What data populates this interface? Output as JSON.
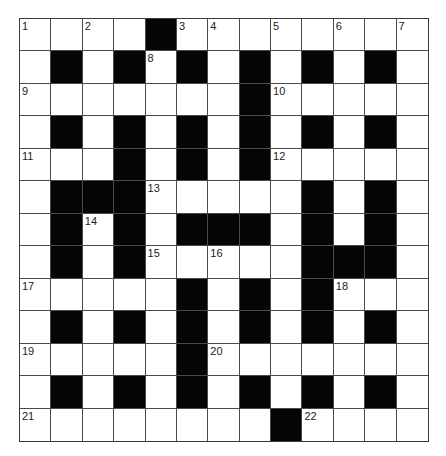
{
  "puzzle": {
    "type": "crossword",
    "rows": 13,
    "cols": 13,
    "colors": {
      "block": "#050505",
      "cell": "#ffffff",
      "gridline": "#4a4a4a",
      "number": "#222222"
    },
    "layout": [
      "0000100000000",
      "0101010101010",
      "0000000100000",
      "0101010101010",
      "0001010100000",
      "0111000001010",
      "0101011101010",
      "0101000001110",
      "0000010101000",
      "0101010101010",
      "0000010000000",
      "0101010101010",
      "0000000010000"
    ],
    "numbers": [
      {
        "row": 0,
        "col": 0,
        "n": "1"
      },
      {
        "row": 0,
        "col": 2,
        "n": "2"
      },
      {
        "row": 0,
        "col": 5,
        "n": "3"
      },
      {
        "row": 0,
        "col": 6,
        "n": "4"
      },
      {
        "row": 0,
        "col": 8,
        "n": "5"
      },
      {
        "row": 0,
        "col": 10,
        "n": "6"
      },
      {
        "row": 0,
        "col": 12,
        "n": "7"
      },
      {
        "row": 1,
        "col": 4,
        "n": "8"
      },
      {
        "row": 2,
        "col": 0,
        "n": "9"
      },
      {
        "row": 2,
        "col": 8,
        "n": "10"
      },
      {
        "row": 4,
        "col": 0,
        "n": "11"
      },
      {
        "row": 4,
        "col": 8,
        "n": "12"
      },
      {
        "row": 5,
        "col": 4,
        "n": "13"
      },
      {
        "row": 6,
        "col": 2,
        "n": "14"
      },
      {
        "row": 7,
        "col": 4,
        "n": "15"
      },
      {
        "row": 7,
        "col": 6,
        "n": "16"
      },
      {
        "row": 8,
        "col": 0,
        "n": "17"
      },
      {
        "row": 8,
        "col": 10,
        "n": "18"
      },
      {
        "row": 10,
        "col": 0,
        "n": "19"
      },
      {
        "row": 10,
        "col": 6,
        "n": "20"
      },
      {
        "row": 12,
        "col": 0,
        "n": "21"
      },
      {
        "row": 12,
        "col": 9,
        "n": "22"
      }
    ],
    "entries": {
      "across": [
        "1",
        "3",
        "9",
        "10",
        "11",
        "12",
        "13",
        "15",
        "17",
        "18",
        "19",
        "20",
        "21",
        "22"
      ],
      "down": [
        "1",
        "2",
        "4",
        "5",
        "6",
        "7",
        "8",
        "14",
        "16"
      ]
    },
    "letters": {}
  }
}
